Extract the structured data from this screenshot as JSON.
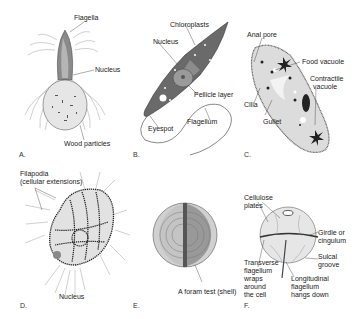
{
  "figure": {
    "panels": [
      {
        "id": "A",
        "letter": "A.",
        "labels": {
          "flagella": "Flagella",
          "nucleus": "Nucleus",
          "wood_particles": "Wood particles"
        }
      },
      {
        "id": "B",
        "letter": "B.",
        "labels": {
          "chloroplasts": "Chloroplasts",
          "nucleus": "Nucleus",
          "pellicle": "Pellicle layer",
          "eyespot": "Eyespot",
          "flagellum": "Flagellum"
        }
      },
      {
        "id": "C",
        "letter": "C.",
        "labels": {
          "anal_pore": "Anal pore",
          "food_vacuole": "Food vacuole",
          "contractile_1": "Contractile",
          "contractile_2": "vacuole",
          "cilia": "Cilia",
          "gullet": "Gullet"
        }
      },
      {
        "id": "D",
        "letter": "D.",
        "labels": {
          "filapodia_1": "Filapodia",
          "filapodia_2": "(cellular extensions)",
          "nucleus": "Nucleus"
        }
      },
      {
        "id": "E",
        "letter": "E.",
        "labels": {
          "test": "A foram test (shell)"
        }
      },
      {
        "id": "F",
        "letter": "F.",
        "labels": {
          "cellulose_1": "Cellulose",
          "cellulose_2": "plates",
          "girdle_1": "Girdle or",
          "girdle_2": "cingulum",
          "sulcal_1": "Sulcal",
          "sulcal_2": "groove",
          "transverse_1": "Transverse",
          "transverse_2": "flagellum",
          "transverse_3": "wraps",
          "transverse_4": "around",
          "transverse_5": "the cell",
          "longitudinal_1": "Longitudinal",
          "longitudinal_2": "flagellum",
          "longitudinal_3": "hangs down"
        }
      }
    ]
  }
}
